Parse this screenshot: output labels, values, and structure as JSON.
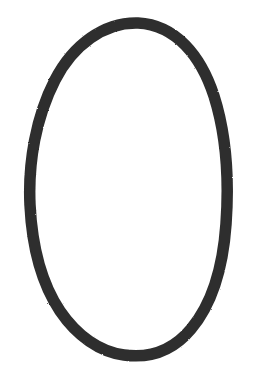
{
  "canvas": {
    "width": 253,
    "height": 385,
    "background_color": "#FFFFFF",
    "description": "Hand-drawn dark oval outline on a plain white background"
  },
  "figure": {
    "name": "hand-drawn-oval",
    "shape_type": "oval-outline",
    "stroke_color": "#2E2E2E",
    "fill_color": "none",
    "stroke_width_px": 11.5,
    "stroke_width_top_px": 12,
    "stroke_width_bottom_px": 13.5,
    "stroke_width_side_px": 10.5,
    "texture": "grainy-scanned-marker",
    "bounds": {
      "left": 29,
      "right": 230,
      "top": 18,
      "bottom": 358,
      "width": 201,
      "height": 340
    },
    "center": {
      "x": 130,
      "y": 188
    },
    "irregularities": [
      "slight apex peak at top near x=140",
      "flattened bottom arc",
      "straight angular segment on upper right",
      "widest left bulge near y=205"
    ],
    "path": "M 138 23 C 176 25 201 56 214 96 C 227 137 229 182 226 224 C 223 267 212 304 191 329 C 171 353 146 358 124 355 C 100 352 77 336 60 311 C 42 284 32 246 30 205 C 28 162 36 117 55 80 C 73 45 104 22 138 23 Z"
  }
}
